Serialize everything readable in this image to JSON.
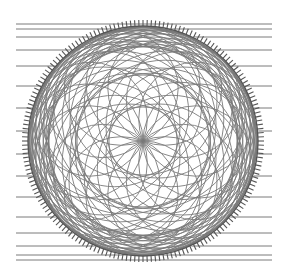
{
  "diagram": {
    "type": "rosette-circle-pattern",
    "background": "#ffffff",
    "line_color": "#7a7a7a",
    "rim_color": "#555555",
    "center": [
      143,
      141
    ],
    "rim_radius": 115,
    "tick_count": 180,
    "tick_length": 6,
    "horizontal_lines": {
      "x_start": 16,
      "x_end": 272,
      "y_positions": [
        24,
        29,
        37,
        50,
        66,
        86,
        108,
        131,
        154,
        176,
        197,
        217,
        233,
        246,
        255,
        260
      ]
    },
    "rosette": {
      "petals": 16,
      "rings": [
        {
          "offset": 57,
          "radius": 57
        },
        {
          "offset": 40,
          "radius": 74
        },
        {
          "offset": 24,
          "radius": 90
        },
        {
          "offset": 10,
          "radius": 104
        }
      ]
    }
  }
}
